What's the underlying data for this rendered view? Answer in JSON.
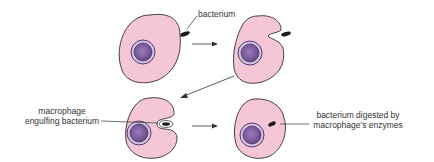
{
  "labels": {
    "bacterium": "bacterium",
    "engulfing_line1": "macrophage",
    "engulfing_line2": "engulfing bacterium",
    "digested_line1": "bacterium digested by",
    "digested_line2": "macrophage's enzymes"
  },
  "colors": {
    "cell_fill": "#f4c6d6",
    "cell_stroke": "#4a3a4a",
    "nucleus_outer": "#c8b4dc",
    "nucleus_inner": "#8a6aa8",
    "nucleus_ring": "#4a3a6a",
    "bacterium": "#1a1a1a",
    "arrow": "#333333"
  },
  "stages": [
    {
      "id": 1,
      "name": "macrophage approaching bacterium"
    },
    {
      "id": 2,
      "name": "macrophage forming pocket"
    },
    {
      "id": 3,
      "name": "macrophage engulfing bacterium"
    },
    {
      "id": 4,
      "name": "bacterium digested"
    }
  ]
}
